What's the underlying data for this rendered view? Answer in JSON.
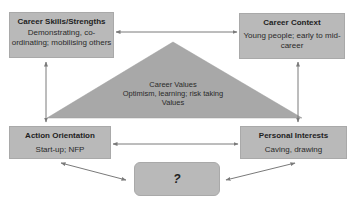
{
  "diagram": {
    "nodes": {
      "career_skills": {
        "title": "Career Skills/Strengths",
        "body": "Demonstrating, co-ordinating; mobilising others"
      },
      "career_context": {
        "title": "Career Context",
        "body": "Young people; early to mid-career"
      },
      "career_values": {
        "title": "Career Values",
        "body": "Optimism, learning; risk taking",
        "footer": "Values"
      },
      "action_orientation": {
        "title": "Action Orientation",
        "body": "Start-up; NFP"
      },
      "personal_interests": {
        "title": "Personal Interests",
        "body": "Caving, drawing"
      },
      "unknown": {
        "label": "?"
      }
    },
    "edges": [
      {
        "from": "career_skills",
        "to": "career_context",
        "type": "bidirectional"
      },
      {
        "from": "career_skills",
        "to": "action_orientation",
        "type": "bidirectional"
      },
      {
        "from": "career_context",
        "to": "personal_interests",
        "type": "bidirectional"
      },
      {
        "from": "action_orientation",
        "to": "personal_interests",
        "type": "bidirectional"
      },
      {
        "from": "action_orientation",
        "to": "unknown",
        "type": "bidirectional"
      },
      {
        "from": "personal_interests",
        "to": "unknown",
        "type": "bidirectional"
      }
    ],
    "colors": {
      "box_fill": "#b9b9b9",
      "triangle_fill": "#a8a8a8",
      "arrow": "#7a7a7a"
    }
  }
}
